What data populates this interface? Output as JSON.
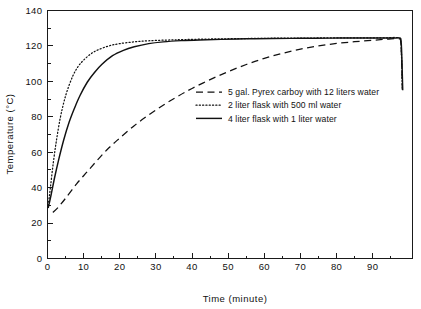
{
  "chart_data": {
    "type": "line",
    "title": "",
    "xlabel": "Time (minute)",
    "ylabel": "Temperature (°C)",
    "xlim": [
      0,
      101
    ],
    "ylim": [
      0,
      140
    ],
    "xticks": [
      0,
      10,
      20,
      30,
      40,
      50,
      60,
      70,
      80,
      90
    ],
    "xticklabels": [
      "0",
      "10",
      "20",
      "30",
      "40",
      "50",
      "60",
      "70",
      "80",
      "90"
    ],
    "xminorticks": [
      5,
      15,
      25,
      35,
      45,
      55,
      65,
      75,
      85,
      95
    ],
    "yticks": [
      0,
      20,
      40,
      60,
      80,
      100,
      120,
      140
    ],
    "yticklabels": [
      "0",
      "20",
      "40",
      "60",
      "80",
      "100",
      "120",
      "140"
    ],
    "yminorticks": [
      10,
      30,
      50,
      70,
      90,
      110,
      130
    ],
    "grid": false,
    "frame": "box",
    "legend_position": "center-right",
    "line_color": "#111111",
    "series": [
      {
        "name": "5 gal. Pyrex carboy with 12 liters water",
        "style": "dashed",
        "x": [
          1.5,
          3,
          5,
          8,
          11,
          14,
          17,
          20,
          24,
          28,
          32,
          36,
          40,
          45,
          50,
          55,
          60,
          65,
          70,
          75,
          80,
          85,
          90,
          94,
          97,
          97.8,
          98.2
        ],
        "y": [
          26,
          29,
          34,
          42,
          49,
          56,
          62.5,
          68,
          75,
          81,
          86.5,
          91.5,
          96,
          101,
          105.5,
          109.5,
          113,
          115.8,
          118.2,
          120,
          121.4,
          122.4,
          123.2,
          123.8,
          124,
          121,
          95
        ]
      },
      {
        "name": "2 liter flask with 500 ml water",
        "style": "dotted",
        "x": [
          0.2,
          0.8,
          1.6,
          2.5,
          3.5,
          4.5,
          5.5,
          7,
          8.5,
          10,
          12,
          14,
          17,
          20,
          24,
          28,
          33,
          38,
          45,
          52,
          60,
          68,
          76,
          84,
          90,
          94,
          97,
          97.8,
          98.2
        ],
        "y": [
          30,
          40,
          54,
          67,
          79,
          88,
          95,
          103,
          108.5,
          112,
          115.5,
          117.8,
          120,
          121.3,
          122.3,
          122.9,
          123.3,
          123.6,
          123.9,
          124.1,
          124.3,
          124.4,
          124.5,
          124.6,
          124.6,
          124.6,
          124.5,
          121,
          95
        ]
      },
      {
        "name": "4 liter flask with 1 liter water",
        "style": "solid",
        "x": [
          0.2,
          1,
          2,
          3,
          4.5,
          6,
          7.5,
          9,
          11,
          13,
          15,
          18,
          21,
          24,
          28,
          32,
          37,
          42,
          48,
          55,
          62,
          70,
          78,
          86,
          92,
          96,
          97.4,
          97.9,
          98.3
        ],
        "y": [
          28.5,
          36,
          46,
          55,
          67,
          77,
          85,
          92,
          99.5,
          105,
          109.5,
          114.5,
          117.5,
          119.5,
          121.3,
          122.3,
          123,
          123.4,
          123.7,
          124,
          124.2,
          124.3,
          124.4,
          124.5,
          124.5,
          124.5,
          124.4,
          121,
          95
        ]
      }
    ]
  },
  "legend": {
    "entries": [
      {
        "label": "5 gal. Pyrex carboy with 12 liters water",
        "style": "dashed"
      },
      {
        "label": "2 liter flask with 500 ml water",
        "style": "dotted"
      },
      {
        "label": "4 liter flask with 1 liter water",
        "style": "solid"
      }
    ]
  }
}
